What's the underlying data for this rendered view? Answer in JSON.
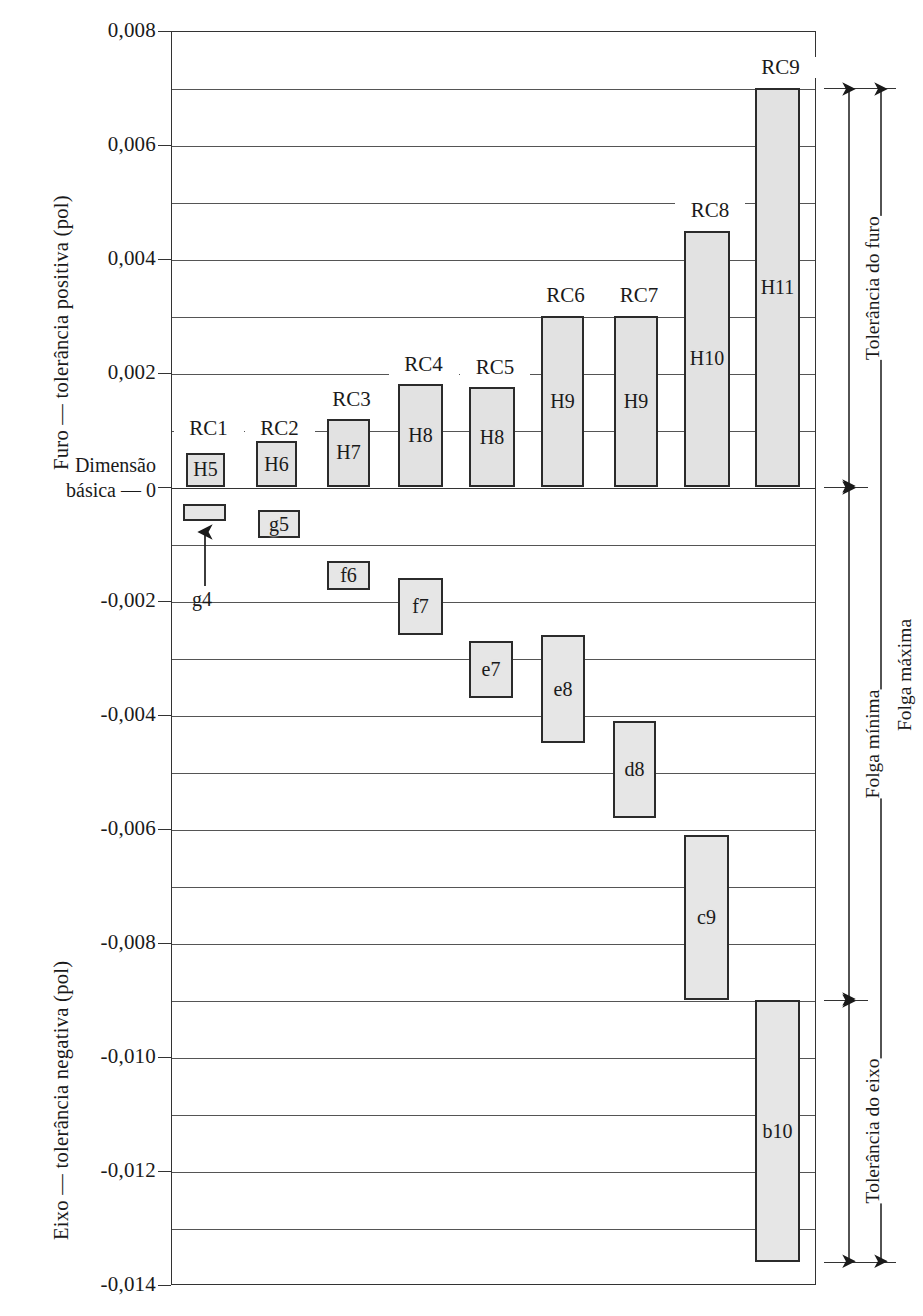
{
  "chart_data": {
    "type": "bar",
    "title": "",
    "ylabel_positive": "Furo — tolerância positiva (pol)",
    "ylabel_negative": "Eixo — tolerância negativa (pol)",
    "basic_dimension_label": "Dimensão básica — 0",
    "units": "pol",
    "ylim": [
      -0.014,
      0.008
    ],
    "ytick_step": 0.001,
    "yticks_labeled": [
      "0,008",
      "0,006",
      "0,004",
      "0,002",
      "0",
      "-0,002",
      "-0,004",
      "-0,006",
      "-0,008",
      "-0,010",
      "-0,012",
      "-0,014"
    ],
    "ytick_values_labeled": [
      0.008,
      0.006,
      0.004,
      0.002,
      0,
      -0.002,
      -0.004,
      -0.006,
      -0.008,
      -0.01,
      -0.012,
      -0.014
    ],
    "grid": true,
    "grid_values": [
      0.008,
      0.007,
      0.006,
      0.005,
      0.004,
      0.003,
      0.002,
      0.001,
      0,
      -0.001,
      -0.002,
      -0.003,
      -0.004,
      -0.005,
      -0.006,
      -0.007,
      -0.008,
      -0.009,
      -0.01,
      -0.011,
      -0.012,
      -0.013,
      -0.014
    ],
    "categories": [
      "RC1",
      "RC2",
      "RC3",
      "RC4",
      "RC5",
      "RC6",
      "RC7",
      "RC8",
      "RC9"
    ],
    "series": [
      {
        "name": "Furo (hole)",
        "grades": [
          "H5",
          "H6",
          "H7",
          "H8",
          "H8",
          "H9",
          "H9",
          "H10",
          "H11"
        ],
        "low": [
          0,
          0,
          0,
          0,
          0,
          0,
          0,
          0,
          0
        ],
        "high": [
          0.0006,
          0.0008,
          0.0012,
          0.0018,
          0.00175,
          0.003,
          0.003,
          0.0045,
          0.007
        ]
      },
      {
        "name": "Eixo (shaft)",
        "grades": [
          "g4",
          "g5",
          "f6",
          "f7",
          "e7",
          "e8",
          "d8",
          "c9",
          "b10"
        ],
        "high": [
          -0.0003,
          -0.0004,
          -0.0013,
          -0.0016,
          -0.0027,
          -0.0026,
          -0.0041,
          -0.0061,
          -0.009
        ],
        "low": [
          -0.0006,
          -0.0009,
          -0.0018,
          -0.0026,
          -0.0037,
          -0.0045,
          -0.0058,
          -0.009,
          -0.0136
        ]
      }
    ],
    "annotations": [
      {
        "id": "tolerancia-do-furo",
        "label": "Tolerância do furo",
        "from": 0.007,
        "to": 0
      },
      {
        "id": "folga-minima",
        "label": "Folga mínima",
        "from": 0,
        "to": -0.009
      },
      {
        "id": "tolerancia-do-eixo",
        "label": "Tolerância do eixo",
        "from": -0.009,
        "to": -0.0136
      },
      {
        "id": "folga-maxima",
        "label": "Folga máxima",
        "from": 0.007,
        "to": -0.0136
      }
    ],
    "callout": {
      "label": "g4",
      "target": "g4-bar"
    }
  },
  "axis": {
    "positive_title": "Furo — tolerância positiva (pol)",
    "negative_title": "Eixo — tolerância negativa (pol)",
    "basic_line1": "Dimensão",
    "basic_line2": "básica — 0",
    "ticks": [
      {
        "text": "0,008",
        "value": 0.008
      },
      {
        "text": "0,006",
        "value": 0.006
      },
      {
        "text": "0,004",
        "value": 0.004
      },
      {
        "text": "0,002",
        "value": 0.002
      },
      {
        "text": "-0,002",
        "value": -0.002
      },
      {
        "text": "-0,004",
        "value": -0.004
      },
      {
        "text": "-0,006",
        "value": -0.006
      },
      {
        "text": "-0,008",
        "value": -0.008
      },
      {
        "text": "-0,010",
        "value": -0.01
      },
      {
        "text": "-0,012",
        "value": -0.012
      },
      {
        "text": "-0,014",
        "value": -0.014
      }
    ]
  },
  "hole_bars": [
    {
      "grade": "H5",
      "fit": "RC1"
    },
    {
      "grade": "H6",
      "fit": "RC2"
    },
    {
      "grade": "H7",
      "fit": "RC3"
    },
    {
      "grade": "H8",
      "fit": "RC4"
    },
    {
      "grade": "H8",
      "fit": "RC5"
    },
    {
      "grade": "H9",
      "fit": "RC6"
    },
    {
      "grade": "H9",
      "fit": "RC7"
    },
    {
      "grade": "H10",
      "fit": "RC8"
    },
    {
      "grade": "H11",
      "fit": "RC9"
    }
  ],
  "shaft_bars": [
    {
      "grade": "g4"
    },
    {
      "grade": "g5"
    },
    {
      "grade": "f6"
    },
    {
      "grade": "f7"
    },
    {
      "grade": "e7"
    },
    {
      "grade": "e8"
    },
    {
      "grade": "d8"
    },
    {
      "grade": "c9"
    },
    {
      "grade": "b10"
    }
  ],
  "fit_labels": [
    "RC1",
    "RC2",
    "RC3",
    "RC4",
    "RC5",
    "RC6",
    "RC7",
    "RC8",
    "RC9"
  ],
  "dimensions": {
    "hole_tolerance": "Tolerância do furo",
    "min_clearance": "Folga mínima",
    "shaft_tolerance": "Tolerância do eixo",
    "max_clearance": "Folga máxima"
  },
  "callout_label": "g4",
  "colors": {
    "bar_fill": "#e2e2e2",
    "bar_stroke": "#2b2b2b",
    "grid": "#555555",
    "frame": "#333333",
    "text": "#1a1a1a"
  }
}
